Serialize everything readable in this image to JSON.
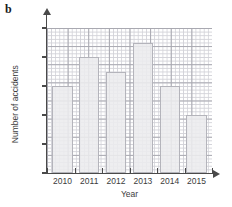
{
  "part_label": "b",
  "chart_data": {
    "type": "bar",
    "title": "",
    "xlabel": "Year",
    "ylabel": "Number of accidents",
    "categories": [
      "2010",
      "2011",
      "2012",
      "2013",
      "2014",
      "2015"
    ],
    "values": [
      6,
      8,
      7,
      9,
      6,
      4
    ],
    "ylim": [
      0,
      10
    ],
    "y_ticks": [
      0,
      2,
      4,
      6,
      8,
      10
    ],
    "y_tick_labels": [
      "0",
      "2",
      "4",
      "6",
      "8",
      "10"
    ],
    "grid": true,
    "grid_style": "graph-paper",
    "legend": "none",
    "bar_fill_color": "#ececee",
    "bar_edge_color": "#b4b4bb",
    "grid_minor_color": "#d2d2d8",
    "grid_major_color": "#a8a8b0",
    "axis_color": "#4a4a4a"
  }
}
